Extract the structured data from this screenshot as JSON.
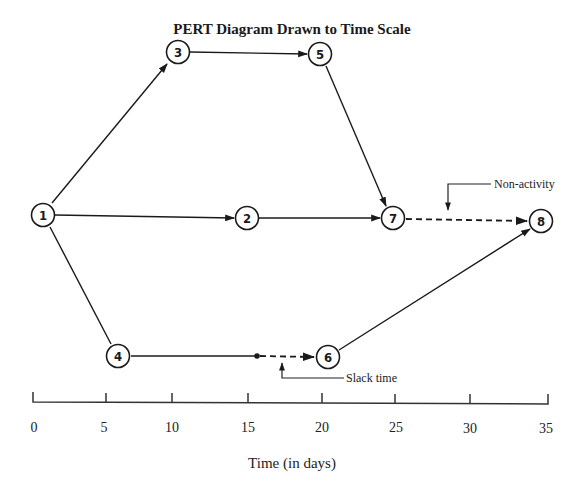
{
  "title": "PERT Diagram Drawn to Time Scale",
  "nodes": [
    {
      "id": "1",
      "label": "1",
      "x": 43,
      "y": 215
    },
    {
      "id": "2",
      "label": "2",
      "x": 247,
      "y": 218
    },
    {
      "id": "3",
      "label": "3",
      "x": 178,
      "y": 52
    },
    {
      "id": "4",
      "label": "4",
      "x": 118,
      "y": 356
    },
    {
      "id": "5",
      "label": "5",
      "x": 320,
      "y": 54
    },
    {
      "id": "6",
      "label": "6",
      "x": 328,
      "y": 357
    },
    {
      "id": "7",
      "label": "7",
      "x": 393,
      "y": 218
    },
    {
      "id": "8",
      "label": "8",
      "x": 541,
      "y": 221
    }
  ],
  "edges": [
    {
      "from": "1",
      "to": "3",
      "style": "solid"
    },
    {
      "from": "1",
      "to": "2",
      "style": "solid"
    },
    {
      "from": "1",
      "to": "4",
      "style": "line"
    },
    {
      "from": "3",
      "to": "5",
      "style": "solid"
    },
    {
      "from": "5",
      "to": "7",
      "style": "solid"
    },
    {
      "from": "2",
      "to": "7",
      "style": "solid"
    },
    {
      "from": "7",
      "to": "8",
      "style": "dashed",
      "note": "Non-activity"
    },
    {
      "from": "4",
      "to": "slack-point",
      "style": "line"
    },
    {
      "from": "slack-point",
      "to": "6",
      "style": "dashed",
      "note": "Slack time"
    },
    {
      "from": "6",
      "to": "8",
      "style": "solid"
    }
  ],
  "annotations": {
    "non_activity": "Non-activity",
    "slack_time": "Slack time"
  },
  "axis": {
    "title": "Time (in days)",
    "ticks": [
      "0",
      "5",
      "10",
      "15",
      "20",
      "25",
      "30",
      "35"
    ]
  },
  "colors": {
    "line": "#1a1a1a",
    "background": "#ffffff"
  }
}
